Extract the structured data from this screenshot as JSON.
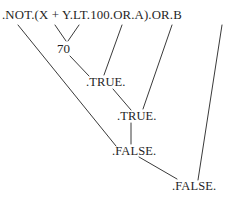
{
  "diagram": {
    "ink_color": "#1f1f1f",
    "background": "#ffffff",
    "width": 233,
    "height": 207,
    "nodes": [
      {
        "id": "expression",
        "label": ".NOT.(X + Y.LT.100.OR.A).OR.B",
        "x": 2,
        "y": 9,
        "kind": "expression"
      },
      {
        "id": "sum",
        "label": "70",
        "x": 57,
        "y": 42,
        "kind": "value"
      },
      {
        "id": "lt",
        "label": ".TRUE.",
        "x": 86,
        "y": 76,
        "kind": "value"
      },
      {
        "id": "or1",
        "label": ".TRUE.",
        "x": 117,
        "y": 110,
        "kind": "value"
      },
      {
        "id": "not",
        "label": ".FALSE.",
        "x": 112,
        "y": 145,
        "kind": "value"
      },
      {
        "id": "or2",
        "label": ".FALSE.",
        "x": 172,
        "y": 180,
        "kind": "value"
      }
    ],
    "edges": [
      {
        "id": "x-to-sum",
        "from": "X",
        "to": "sum",
        "x1": 55,
        "y1": 25,
        "x2": 66,
        "y2": 41
      },
      {
        "id": "y-to-sum",
        "from": "Y",
        "to": "sum",
        "x1": 79,
        "y1": 25,
        "x2": 68,
        "y2": 41
      },
      {
        "id": "sum-to-lt",
        "from": "sum",
        "to": "lt",
        "x1": 70,
        "y1": 56,
        "x2": 89,
        "y2": 76
      },
      {
        "id": "const-to-lt",
        "from": "100",
        "to": "lt",
        "x1": 122,
        "y1": 25,
        "x2": 104,
        "y2": 75
      },
      {
        "id": "lt-to-or1",
        "from": "lt",
        "to": "or1",
        "x1": 113,
        "y1": 89,
        "x2": 131,
        "y2": 110
      },
      {
        "id": "a-to-or1",
        "from": "A",
        "to": "or1",
        "x1": 172,
        "y1": 25,
        "x2": 143,
        "y2": 109
      },
      {
        "id": "or1-to-not",
        "from": "or1",
        "to": "not",
        "x1": 131,
        "y1": 123,
        "x2": 131,
        "y2": 144
      },
      {
        "id": "notop-to-not",
        "from": ".NOT.",
        "to": "not",
        "x1": 18,
        "y1": 25,
        "x2": 116,
        "y2": 146
      },
      {
        "id": "not-to-or2",
        "from": "not",
        "to": "or2",
        "x1": 139,
        "y1": 157,
        "x2": 177,
        "y2": 179
      },
      {
        "id": "b-to-or2",
        "from": "B",
        "to": "or2",
        "x1": 222,
        "y1": 25,
        "x2": 198,
        "y2": 180
      }
    ]
  }
}
